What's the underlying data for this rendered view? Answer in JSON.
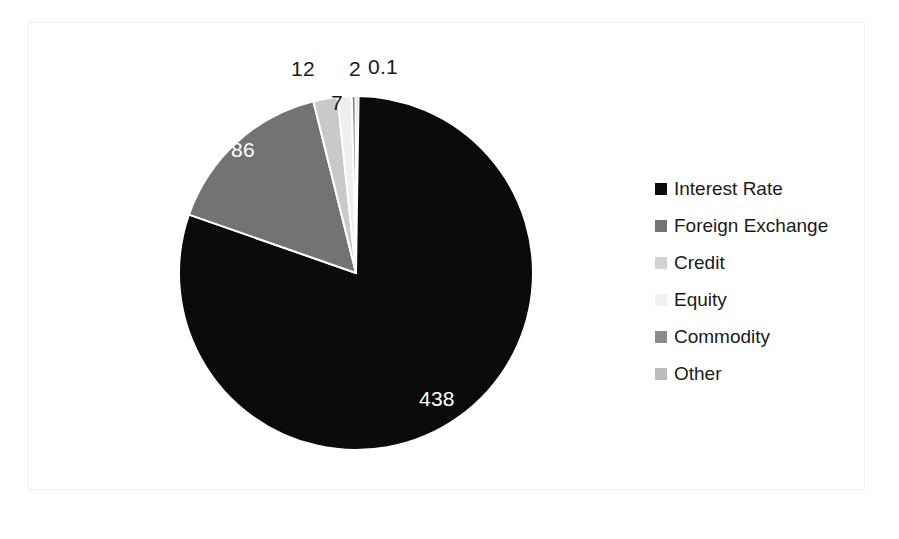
{
  "chart_data": {
    "type": "pie",
    "title": "",
    "subtitle": "",
    "xlabel": "",
    "ylabel": "",
    "grid": false,
    "legend_position": "right",
    "total": 545.1,
    "units": "",
    "start_angle_deg": 0,
    "direction": "clockwise",
    "categories": [
      "Interest Rate",
      "Foreign Exchange",
      "Credit",
      "Equity",
      "Commodity",
      "Other"
    ],
    "values": [
      438,
      86,
      12,
      7,
      2,
      0.1
    ],
    "value_labels": [
      "438",
      "86",
      "12",
      "7",
      "2",
      "0.1"
    ],
    "colors": [
      "#0b0b0b",
      "#737373",
      "#c9c9c9",
      "#efefef",
      "#8a8a8a",
      "#b5b5b5"
    ],
    "label_placement": [
      "inside",
      "inside",
      "outside",
      "inside",
      "outside",
      "outside"
    ],
    "slices": [
      {
        "name": "Interest Rate",
        "value": 438,
        "label": "438",
        "color": "#0b0b0b",
        "label_color": "#ffffff"
      },
      {
        "name": "Foreign Exchange",
        "value": 86,
        "label": "86",
        "color": "#737373",
        "label_color": "#ffffff"
      },
      {
        "name": "Credit",
        "value": 12,
        "label": "12",
        "color": "#c9c9c9",
        "label_color": "#1a1a1a"
      },
      {
        "name": "Equity",
        "value": 7,
        "label": "7",
        "color": "#efefef",
        "label_color": "#1a1a1a"
      },
      {
        "name": "Commodity",
        "value": 2,
        "label": "2",
        "color": "#8a8a8a",
        "label_color": "#1a1a1a"
      },
      {
        "name": "Other",
        "value": 0.1,
        "label": "0.1",
        "color": "#b5b5b5",
        "label_color": "#1a1a1a"
      }
    ]
  },
  "legend": {
    "items": [
      {
        "label": "Interest Rate",
        "color": "#0b0b0b"
      },
      {
        "label": "Foreign Exchange",
        "color": "#737373"
      },
      {
        "label": "Credit",
        "color": "#d2d2d2"
      },
      {
        "label": "Equity",
        "color": "#f1f1f1"
      },
      {
        "label": "Commodity",
        "color": "#8a8a8a"
      },
      {
        "label": "Other",
        "color": "#bdbdbd"
      }
    ]
  },
  "geometry": {
    "center_x": 356,
    "center_y": 273,
    "radius": 177
  }
}
